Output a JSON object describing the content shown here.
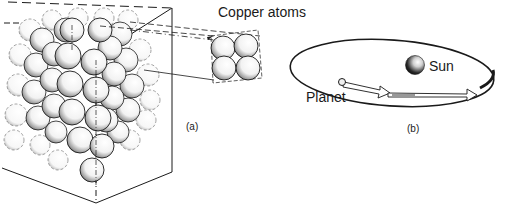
{
  "figure": {
    "panel_a": {
      "caption": "(a)",
      "callout_label": "Copper atoms",
      "description": "Cube of stacked copper atoms with enlarged unit of four atoms"
    },
    "panel_b": {
      "caption": "(b)",
      "sun_label": "Sun",
      "planet_label": "Planet",
      "description": "Planet orbiting the Sun along an elliptical path with direction arrows"
    }
  },
  "colors": {
    "ink": "#1a1a1a",
    "background": "#ffffff",
    "shade": "#555555"
  }
}
